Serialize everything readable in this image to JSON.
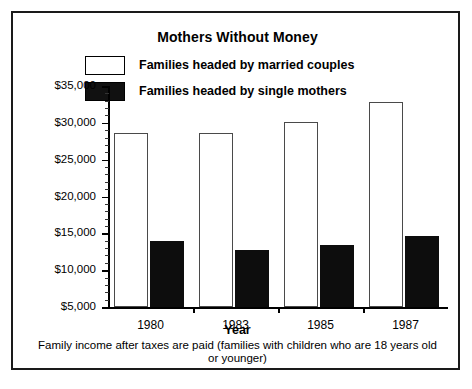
{
  "chart_data": {
    "type": "bar",
    "title": "Mothers Without Money",
    "xlabel": "Year",
    "ylabel": "",
    "caption": "Family income after taxes are paid (families with children who are 18 years old or younger)",
    "categories": [
      "1980",
      "1983",
      "1985",
      "1987"
    ],
    "series": [
      {
        "name": "Families headed by married couples",
        "color": "#ffffff",
        "values": [
          28600,
          28600,
          30100,
          32800
        ]
      },
      {
        "name": "Families headed by single mothers",
        "color": "#0d0d0d",
        "values": [
          13900,
          12700,
          13400,
          14600
        ]
      }
    ],
    "ylim": [
      5000,
      35000
    ],
    "ytick_values": [
      5000,
      10000,
      15000,
      20000,
      25000,
      30000,
      35000
    ],
    "ytick_labels": [
      "$5,000",
      "$10,000",
      "$15,000",
      "$20,000",
      "$25,000",
      "$30,000",
      "$35,000"
    ],
    "ytick_minor_step": 1000,
    "grid": false,
    "legend_position": "top-inside"
  },
  "legend": {
    "items": [
      {
        "label": "Families headed by married couples",
        "swatch": "white-square-swatch"
      },
      {
        "label": "Families headed by single mothers",
        "swatch": "black-square-swatch"
      }
    ]
  }
}
